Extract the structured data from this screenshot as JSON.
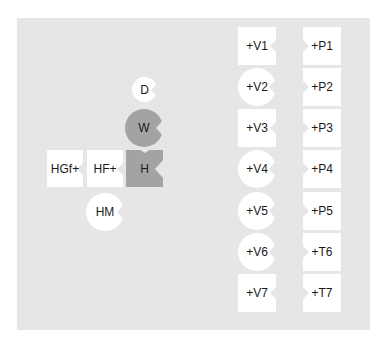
{
  "diagram": {
    "background": "#e6e6e6",
    "colors": {
      "white_shape": "#ffffff",
      "gray_shape": "#a3a3a3",
      "text": "#1a1a1a"
    },
    "left_group": {
      "D": {
        "label": "D",
        "shape": "circle",
        "fill": "white"
      },
      "W": {
        "label": "W",
        "shape": "circle",
        "fill": "gray"
      },
      "H": {
        "label": "H",
        "shape": "square",
        "fill": "gray"
      },
      "HGf": {
        "label": "HGf+",
        "shape": "square",
        "fill": "white"
      },
      "HF": {
        "label": "HF+",
        "shape": "square",
        "fill": "white"
      },
      "HM": {
        "label": "HM",
        "shape": "circle",
        "fill": "white"
      }
    },
    "right_group": {
      "left_column": [
        {
          "label": "+V1",
          "shape": "square"
        },
        {
          "label": "+V2",
          "shape": "circle"
        },
        {
          "label": "+V3",
          "shape": "square"
        },
        {
          "label": "+V4",
          "shape": "circle"
        },
        {
          "label": "+V5",
          "shape": "circle"
        },
        {
          "label": "+V6",
          "shape": "circle"
        },
        {
          "label": "+V7",
          "shape": "square"
        }
      ],
      "right_column": [
        {
          "label": "+P1",
          "shape": "square"
        },
        {
          "label": "+P2",
          "shape": "square"
        },
        {
          "label": "+P3",
          "shape": "square"
        },
        {
          "label": "+P4",
          "shape": "square"
        },
        {
          "label": "+P5",
          "shape": "square"
        },
        {
          "label": "+T6",
          "shape": "square"
        },
        {
          "label": "+T7",
          "shape": "square"
        }
      ]
    }
  }
}
